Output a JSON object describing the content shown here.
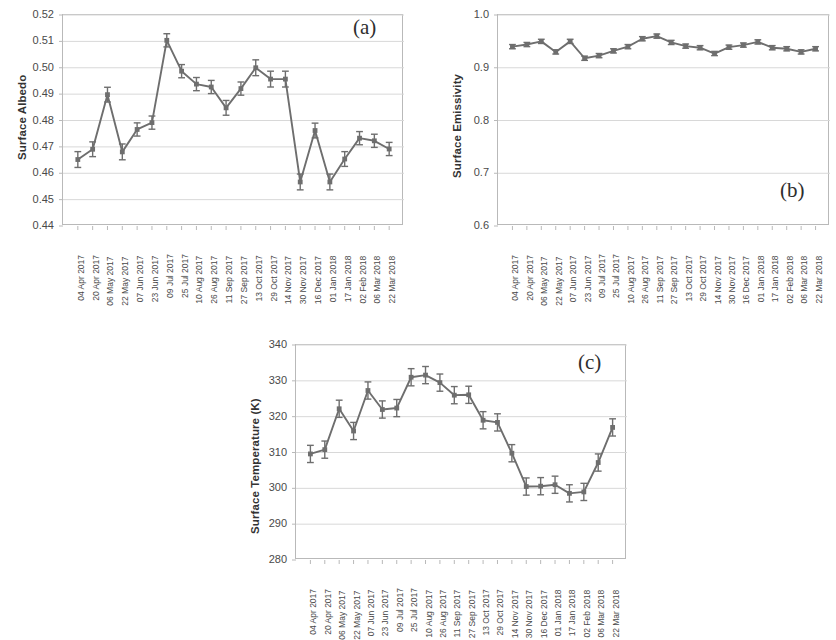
{
  "figure": {
    "background": "#ffffff",
    "series_color": "#6e6e6e",
    "grid_color": "#d8d8d8",
    "axis_color": "#b9b9b9"
  },
  "dates": [
    "04 Apr 2017",
    "20 Apr 2017",
    "06 May 2017",
    "22 May 2017",
    "07 Jun 2017",
    "23 Jun 2017",
    "09 Jul 2017",
    "25 Jul 2017",
    "10 Aug 2017",
    "26 Aug 2017",
    "11 Sep 2017",
    "27 Sep 2017",
    "13 Oct 2017",
    "29 Oct 2017",
    "14 Nov 2017",
    "30 Nov 2017",
    "16 Dec 2017",
    "01 Jan 2018",
    "17 Jan 2018",
    "02 Feb 2018",
    "06 Mar 2018",
    "22 Mar 2018"
  ],
  "chart_data": [
    {
      "type": "line",
      "panel": "(a)",
      "title": "",
      "xlabel": "",
      "ylabel": "Surface Albedo",
      "ylim": [
        0.44,
        0.52
      ],
      "yticks": [
        "0.44",
        "0.45",
        "0.46",
        "0.47",
        "0.48",
        "0.49",
        "0.50",
        "0.51",
        "0.52"
      ],
      "ytick_values": [
        0.44,
        0.45,
        0.46,
        0.47,
        0.48,
        0.49,
        0.5,
        0.51,
        0.52
      ],
      "grid": true,
      "legend": "none",
      "markers": "square",
      "error_bars": true,
      "x": [
        "04 Apr 2017",
        "20 Apr 2017",
        "06 May 2017",
        "22 May 2017",
        "07 Jun 2017",
        "23 Jun 2017",
        "09 Jul 2017",
        "25 Jul 2017",
        "10 Aug 2017",
        "26 Aug 2017",
        "11 Sep 2017",
        "27 Sep 2017",
        "13 Oct 2017",
        "29 Oct 2017",
        "14 Nov 2017",
        "30 Nov 2017",
        "16 Dec 2017",
        "01 Jan 2018",
        "17 Jan 2018",
        "02 Feb 2018",
        "06 Mar 2018",
        "22 Mar 2018"
      ],
      "values": [
        0.4652,
        0.4691,
        0.4898,
        0.4681,
        0.4766,
        0.4792,
        0.5104,
        0.4987,
        0.4938,
        0.4927,
        0.4848,
        0.4921,
        0.5,
        0.4957,
        0.4957,
        0.4567,
        0.4762,
        0.4567,
        0.4654,
        0.4733,
        0.4723,
        0.4692
      ],
      "errors": [
        0.003,
        0.0028,
        0.0028,
        0.003,
        0.0025,
        0.0025,
        0.0025,
        0.0025,
        0.0025,
        0.0025,
        0.0028,
        0.0025,
        0.003,
        0.003,
        0.003,
        0.003,
        0.0028,
        0.003,
        0.0028,
        0.0025,
        0.0025,
        0.0025
      ]
    },
    {
      "type": "line",
      "panel": "(b)",
      "title": "",
      "xlabel": "",
      "ylabel": "Surface Emissivity",
      "ylim": [
        0.6,
        1.0
      ],
      "yticks": [
        "0.6",
        "0.7",
        "0.8",
        "0.9",
        "1.0"
      ],
      "ytick_values": [
        0.6,
        0.7,
        0.8,
        0.9,
        1.0
      ],
      "grid": true,
      "legend": "none",
      "markers": "square",
      "error_bars": true,
      "x": [
        "04 Apr 2017",
        "20 Apr 2017",
        "06 May 2017",
        "22 May 2017",
        "07 Jun 2017",
        "23 Jun 2017",
        "09 Jul 2017",
        "25 Jul 2017",
        "10 Aug 2017",
        "26 Aug 2017",
        "11 Sep 2017",
        "27 Sep 2017",
        "13 Oct 2017",
        "29 Oct 2017",
        "14 Nov 2017",
        "30 Nov 2017",
        "16 Dec 2017",
        "01 Jan 2018",
        "17 Jan 2018",
        "02 Feb 2018",
        "06 Mar 2018",
        "22 Mar 2018"
      ],
      "values": [
        0.94,
        0.944,
        0.95,
        0.93,
        0.95,
        0.918,
        0.923,
        0.932,
        0.94,
        0.955,
        0.96,
        0.948,
        0.941,
        0.938,
        0.927,
        0.939,
        0.943,
        0.949,
        0.938,
        0.936,
        0.93,
        0.936
      ],
      "errors": [
        0.004,
        0.004,
        0.004,
        0.004,
        0.004,
        0.004,
        0.004,
        0.004,
        0.004,
        0.004,
        0.004,
        0.004,
        0.004,
        0.004,
        0.004,
        0.004,
        0.004,
        0.004,
        0.004,
        0.004,
        0.004,
        0.004
      ]
    },
    {
      "type": "line",
      "panel": "(c)",
      "title": "",
      "xlabel": "",
      "ylabel": "Surface Temperature (K)",
      "ylim": [
        280,
        340
      ],
      "yticks": [
        "280",
        "290",
        "300",
        "310",
        "320",
        "330",
        "340"
      ],
      "ytick_values": [
        280,
        290,
        300,
        310,
        320,
        330,
        340
      ],
      "grid": true,
      "legend": "none",
      "markers": "square",
      "error_bars": true,
      "x": [
        "04 Apr 2017",
        "20 Apr 2017",
        "06 May 2017",
        "22 May 2017",
        "07 Jun 2017",
        "23 Jun 2017",
        "09 Jul 2017",
        "25 Jul 2017",
        "10 Aug 2017",
        "26 Aug 2017",
        "11 Sep 2017",
        "27 Sep 2017",
        "13 Oct 2017",
        "29 Oct 2017",
        "14 Nov 2017",
        "30 Nov 2017",
        "16 Dec 2017",
        "01 Jan 2018",
        "17 Jan 2018",
        "02 Feb 2018",
        "06 Mar 2018",
        "22 Mar 2018"
      ],
      "values": [
        309.6,
        310.8,
        322.2,
        316.0,
        327.3,
        322.0,
        322.4,
        331.0,
        331.6,
        329.5,
        326.0,
        326.1,
        319.0,
        318.4,
        309.8,
        300.5,
        300.6,
        301.0,
        298.6,
        299.0,
        307.2,
        317.0
      ],
      "errors": [
        2.4,
        2.4,
        2.4,
        2.4,
        2.4,
        2.4,
        2.4,
        2.4,
        2.4,
        2.4,
        2.4,
        2.4,
        2.4,
        2.4,
        2.4,
        2.4,
        2.4,
        2.4,
        2.4,
        2.4,
        2.4,
        2.4
      ]
    }
  ],
  "panels": [
    {
      "tag": "(a)",
      "ylabel": "Surface Albedo",
      "geometry": {
        "plot_left": 62,
        "plot_top": 14,
        "plot_width": 341,
        "plot_height": 211,
        "ylabel_x": 16,
        "ylabel_y": 160,
        "tag_x": 353,
        "tag_y": 15
      }
    },
    {
      "tag": "(b)",
      "ylabel": "Surface Emissivity",
      "geometry": {
        "plot_left": 497,
        "plot_top": 14,
        "plot_width": 332,
        "plot_height": 211,
        "ylabel_x": 451,
        "ylabel_y": 178,
        "tag_x": 780,
        "tag_y": 178
      }
    },
    {
      "tag": "(c)",
      "ylabel": "Surface Temperature (K)",
      "geometry": {
        "plot_left": 295,
        "plot_top": 344,
        "plot_width": 331,
        "plot_height": 215,
        "ylabel_x": 249,
        "ylabel_y": 534,
        "tag_x": 578,
        "tag_y": 350
      }
    }
  ]
}
